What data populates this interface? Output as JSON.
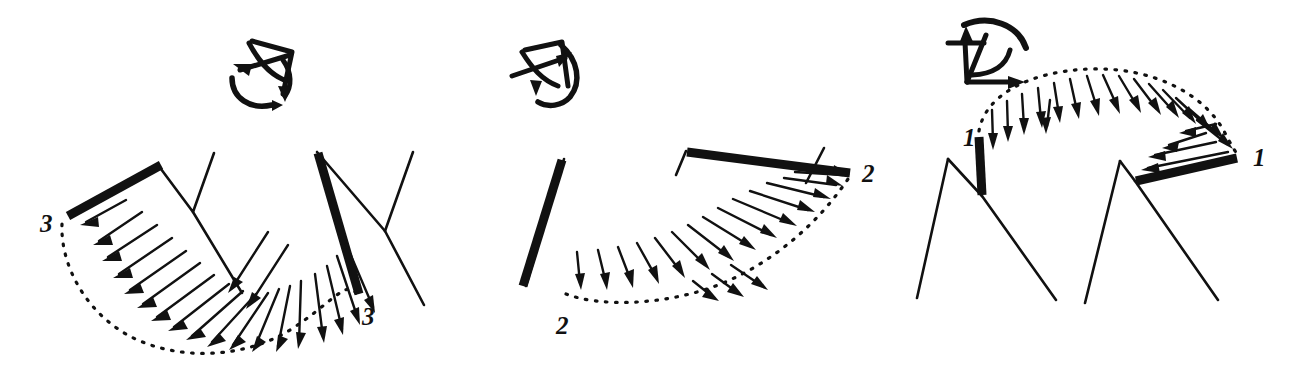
{
  "figure": {
    "title": "",
    "background": "#ffffff",
    "ink_color": "#111111",
    "panel_count": 3
  },
  "panels": [
    {
      "id": "panel-left",
      "mode_label": "3",
      "labels": [
        {
          "name": "start-label",
          "text": "3",
          "x": 40,
          "y": 232
        },
        {
          "name": "end-label",
          "text": "3",
          "x": 362,
          "y": 325
        }
      ],
      "axis_icon": {
        "name": "rotation-axes-icon",
        "description": "hand-drawn coordinate axes with curved rotation arrow",
        "x": 222,
        "y": 28
      },
      "arrow_count": 22,
      "sweep": "downward-left to downward-right through a U shaped dotted arc",
      "bars": [
        {
          "name": "initial-bar",
          "x1": 68,
          "y1": 216,
          "x2": 160,
          "y2": 165
        },
        {
          "name": "final-bar",
          "x1": 317,
          "y1": 152,
          "x2": 360,
          "y2": 295
        }
      ]
    },
    {
      "id": "panel-middle",
      "mode_label": "2",
      "labels": [
        {
          "name": "start-label",
          "text": "2",
          "x": 556,
          "y": 330
        },
        {
          "name": "end-label",
          "text": "2",
          "x": 862,
          "y": 180
        }
      ],
      "axis_icon": {
        "name": "rotation-axes-icon",
        "description": "hand-drawn coordinate axes with curved rotation arrow",
        "x": 508,
        "y": 28
      },
      "arrow_count": 22,
      "sweep": "downward at left sweeping to rightward at upper right along dotted arc",
      "bars": [
        {
          "name": "initial-bar",
          "x1": 522,
          "y1": 285,
          "x2": 563,
          "y2": 160
        },
        {
          "name": "final-bar",
          "x1": 686,
          "y1": 151,
          "x2": 850,
          "y2": 172
        }
      ]
    },
    {
      "id": "panel-right",
      "mode_label": "1",
      "labels": [
        {
          "name": "start-label",
          "text": "1",
          "x": 966,
          "y": 142
        },
        {
          "name": "end-label",
          "text": "1",
          "x": 1258,
          "y": 160
        }
      ],
      "axis_icon": {
        "name": "rotation-axes-icon",
        "description": "hand-drawn coordinate axes with curved rotation arrow",
        "x": 945,
        "y": 18
      },
      "arrow_count": 24,
      "sweep": "downward at left sweeping over the top of a dotted semicircle to leftward at right",
      "bars": [
        {
          "name": "initial-bar",
          "x1": 978,
          "y1": 136,
          "x2": 982,
          "y2": 196
        },
        {
          "name": "final-bar",
          "x1": 1135,
          "y1": 180,
          "x2": 1238,
          "y2": 158
        }
      ]
    }
  ],
  "legend": {
    "dotted_arc": "rotation path",
    "thick_bar": "rigid body position",
    "thin_lines": "construction lines",
    "arrows": "velocity / displacement vectors"
  }
}
